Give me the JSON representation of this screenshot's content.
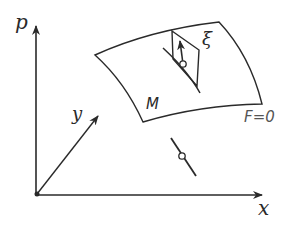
{
  "figure": {
    "colors": {
      "stroke": "#2a2a2a",
      "background": "#ffffff"
    }
  },
  "axes": {
    "vertical_label": "p",
    "horizontal_label": "x",
    "diagonal_label": "y"
  },
  "surface": {
    "name_label": "M",
    "equation_label": "F=0"
  },
  "tangent_plane": {
    "vector_label": "ξ"
  }
}
